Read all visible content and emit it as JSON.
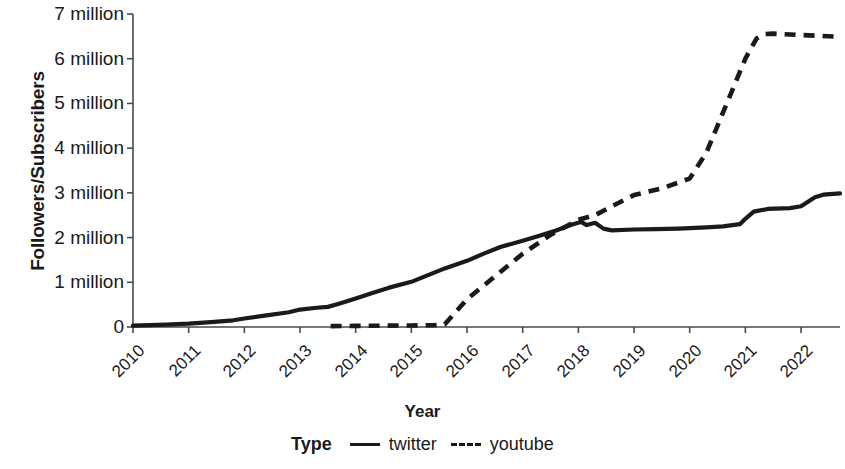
{
  "chart_data": {
    "type": "line",
    "title": "",
    "xlabel": "Year",
    "ylabel": "Followers/Subscribers",
    "xlim": [
      2010,
      2022.7
    ],
    "ylim": [
      0,
      7000000
    ],
    "grid": false,
    "legend_position": "bottom",
    "legend_title": "Type",
    "x_tick_labels": [
      "2010",
      "2011",
      "2012",
      "2013",
      "2014",
      "2015",
      "2016",
      "2017",
      "2018",
      "2019",
      "2020",
      "2021",
      "2022"
    ],
    "x_tick_values": [
      2010,
      2011,
      2012,
      2013,
      2014,
      2015,
      2016,
      2017,
      2018,
      2019,
      2020,
      2021,
      2022
    ],
    "y_tick_labels": [
      "0",
      "1 million",
      "2 million",
      "3 million",
      "4 million",
      "5 million",
      "6 million",
      "7 million"
    ],
    "y_tick_values": [
      0,
      1000000,
      2000000,
      3000000,
      4000000,
      5000000,
      6000000,
      7000000
    ],
    "series": [
      {
        "name": "twitter",
        "style": "solid",
        "color": "#1a1a1a",
        "x": [
          2010.0,
          2010.3,
          2010.6,
          2011.0,
          2011.4,
          2011.8,
          2012.0,
          2012.4,
          2012.8,
          2013.0,
          2013.3,
          2013.5,
          2013.7,
          2014.0,
          2014.3,
          2014.6,
          2015.0,
          2015.3,
          2015.6,
          2016.0,
          2016.3,
          2016.6,
          2017.0,
          2017.3,
          2017.6,
          2017.9,
          2018.05,
          2018.15,
          2018.3,
          2018.45,
          2018.6,
          2019.0,
          2019.4,
          2019.8,
          2020.0,
          2020.3,
          2020.6,
          2020.9,
          2021.0,
          2021.15,
          2021.4,
          2021.8,
          2022.0,
          2022.25,
          2022.4,
          2022.7
        ],
        "y": [
          30000,
          40000,
          55000,
          75000,
          110000,
          150000,
          190000,
          260000,
          330000,
          390000,
          430000,
          450000,
          520000,
          640000,
          760000,
          880000,
          1010000,
          1160000,
          1310000,
          1480000,
          1640000,
          1790000,
          1930000,
          2040000,
          2160000,
          2300000,
          2350000,
          2280000,
          2330000,
          2200000,
          2160000,
          2180000,
          2190000,
          2200000,
          2210000,
          2230000,
          2250000,
          2300000,
          2420000,
          2580000,
          2640000,
          2660000,
          2700000,
          2900000,
          2960000,
          2990000
        ]
      },
      {
        "name": "youtube",
        "style": "dashed",
        "color": "#1a1a1a",
        "x": [
          2013.55,
          2014.0,
          2014.5,
          2015.0,
          2015.4,
          2015.6,
          2016.0,
          2016.5,
          2017.0,
          2017.5,
          2018.0,
          2018.3,
          2018.6,
          2019.0,
          2019.5,
          2020.0,
          2020.3,
          2020.6,
          2021.0,
          2021.2,
          2021.35,
          2021.5,
          2022.0,
          2022.7
        ],
        "y": [
          20000,
          25000,
          30000,
          35000,
          40000,
          60000,
          620000,
          1130000,
          1640000,
          2060000,
          2400000,
          2500000,
          2700000,
          2950000,
          3100000,
          3320000,
          3900000,
          4800000,
          6000000,
          6450000,
          6550000,
          6560000,
          6530000,
          6490000
        ]
      }
    ]
  },
  "axes": {
    "y_title": "Followers/Subscribers",
    "x_title": "Year"
  },
  "legend": {
    "title": "Type",
    "entries": [
      {
        "label": "twitter",
        "style": "solid"
      },
      {
        "label": "youtube",
        "style": "dashed"
      }
    ]
  }
}
